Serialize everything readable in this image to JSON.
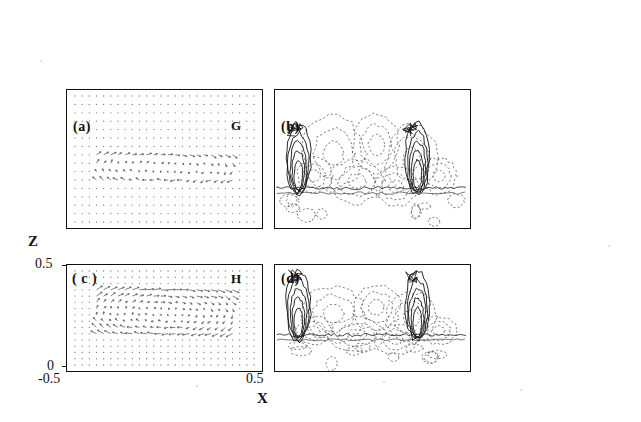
{
  "figure": {
    "panels": [
      {
        "id": "a",
        "label": "(a)",
        "tag": "G",
        "type": "vector-field",
        "position": "top-left"
      },
      {
        "id": "b",
        "label": "(b)",
        "tag": "",
        "type": "contour-plot",
        "position": "top-right"
      },
      {
        "id": "c",
        "label": "( c )",
        "tag": "H",
        "type": "vector-field",
        "position": "bottom-left"
      },
      {
        "id": "d",
        "label": "(d)",
        "tag": "",
        "type": "contour-plot",
        "position": "bottom-right"
      }
    ],
    "axes": {
      "ylabel": "Z",
      "xlabel": "X",
      "yticks": [
        "0.5",
        "0"
      ],
      "xticks": [
        "-0.5",
        "0.5"
      ]
    },
    "colors": {
      "ink": "#111111",
      "background": "#ffffff",
      "dots": "#555555",
      "dashed": "#444444"
    }
  },
  "chart_data": {
    "type": "line",
    "title": "",
    "xlabel": "X",
    "ylabel": "Z",
    "xlim": [
      -0.5,
      0.5
    ],
    "ylim": [
      0,
      0.5
    ],
    "grid": false,
    "legend": "none",
    "panels": [
      {
        "name": "(a)",
        "annotation": "G",
        "description": "velocity vector field, upper cell region",
        "x": [
          -0.5,
          0.5
        ],
        "z": [
          0,
          0.5
        ]
      },
      {
        "name": "(b)",
        "annotation": "",
        "description": "contour field with solid and dashed contours, two plume structures",
        "x": [
          -0.5,
          0.5
        ],
        "z": [
          0,
          0.5
        ]
      },
      {
        "name": "( c )",
        "annotation": "H",
        "description": "velocity vector field, upper cell region",
        "x": [
          -0.5,
          0.5
        ],
        "z": [
          0,
          0.5
        ]
      },
      {
        "name": "(d)",
        "annotation": "",
        "description": "contour field with solid and dashed contours, two plume structures",
        "x": [
          -0.5,
          0.5
        ],
        "z": [
          0,
          0.5
        ]
      }
    ]
  }
}
